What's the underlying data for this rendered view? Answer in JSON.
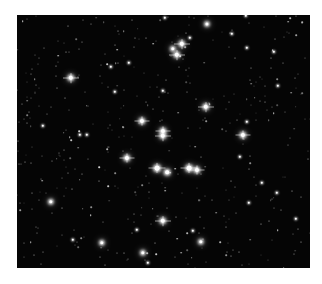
{
  "image": {
    "description": "Black-and-white astronomical photograph of an open star cluster",
    "background_color": "#050505",
    "frame": {
      "left": 17,
      "top": 15,
      "width": 293,
      "height": 253
    },
    "bright_stars": [
      {
        "x": 182,
        "y": 44,
        "r": 3.2
      },
      {
        "x": 177,
        "y": 55,
        "r": 3.2
      },
      {
        "x": 173,
        "y": 49,
        "r": 2.4
      },
      {
        "x": 207,
        "y": 24,
        "r": 2.2
      },
      {
        "x": 71,
        "y": 78,
        "r": 3.2
      },
      {
        "x": 206,
        "y": 107,
        "r": 3.2
      },
      {
        "x": 142,
        "y": 121,
        "r": 3
      },
      {
        "x": 163,
        "y": 131,
        "r": 3
      },
      {
        "x": 163,
        "y": 136,
        "r": 3.2
      },
      {
        "x": 243,
        "y": 135,
        "r": 3
      },
      {
        "x": 127,
        "y": 158,
        "r": 3
      },
      {
        "x": 157,
        "y": 168,
        "r": 3.4
      },
      {
        "x": 167,
        "y": 172,
        "r": 2.6
      },
      {
        "x": 189,
        "y": 168,
        "r": 3.4
      },
      {
        "x": 197,
        "y": 170,
        "r": 3
      },
      {
        "x": 163,
        "y": 221,
        "r": 3.2
      },
      {
        "x": 51,
        "y": 202,
        "r": 2.4
      },
      {
        "x": 102,
        "y": 243,
        "r": 2.4
      },
      {
        "x": 201,
        "y": 242,
        "r": 2.4
      },
      {
        "x": 143,
        "y": 253,
        "r": 2.4
      }
    ],
    "medium_stars": [
      {
        "x": 247,
        "y": 48
      },
      {
        "x": 274,
        "y": 52
      },
      {
        "x": 129,
        "y": 63
      },
      {
        "x": 111,
        "y": 67
      },
      {
        "x": 163,
        "y": 91
      },
      {
        "x": 115,
        "y": 92
      },
      {
        "x": 87,
        "y": 135
      },
      {
        "x": 240,
        "y": 157
      },
      {
        "x": 262,
        "y": 183
      },
      {
        "x": 277,
        "y": 193
      },
      {
        "x": 148,
        "y": 263
      },
      {
        "x": 232,
        "y": 34
      },
      {
        "x": 246,
        "y": 16
      },
      {
        "x": 165,
        "y": 18
      },
      {
        "x": 190,
        "y": 38
      },
      {
        "x": 278,
        "y": 86
      },
      {
        "x": 43,
        "y": 126
      },
      {
        "x": 80,
        "y": 135
      },
      {
        "x": 247,
        "y": 122
      },
      {
        "x": 137,
        "y": 230
      },
      {
        "x": 249,
        "y": 203
      },
      {
        "x": 193,
        "y": 231
      },
      {
        "x": 296,
        "y": 219
      },
      {
        "x": 73,
        "y": 240
      }
    ]
  }
}
